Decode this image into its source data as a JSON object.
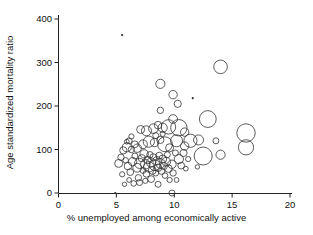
{
  "chart_data": {
    "type": "scatter",
    "title": "",
    "subtitle": "",
    "xlabel": "% unemployed among economically active",
    "ylabel": "Age standardized mortality ratio",
    "xlim": [
      0,
      20
    ],
    "ylim": [
      0,
      400
    ],
    "xticks": [
      0,
      5,
      10,
      15,
      20
    ],
    "yticks": [
      0,
      100,
      200,
      300,
      400
    ],
    "xtick_labels": [
      "0",
      "5",
      "10",
      "15",
      "20"
    ],
    "ytick_labels": [
      "0",
      "100",
      "200",
      "300",
      "400"
    ],
    "grid": false,
    "legend": null,
    "marker": {
      "style": "open-circle",
      "stroke": "#333333",
      "stroke_width": 0.8,
      "fill": "none",
      "size_encodes": "population weight"
    },
    "annotations": [],
    "note": "Bubble plot: marker area scaled by a third variable (weight). r values are in pixel radius as drawn.",
    "points": [
      {
        "x": 5.5,
        "y": 363,
        "r": 1.1
      },
      {
        "x": 11.6,
        "y": 218,
        "r": 1.1
      },
      {
        "x": 4.9,
        "y": 0,
        "r": 1.1
      },
      {
        "x": 14.0,
        "y": 290,
        "r": 6.8
      },
      {
        "x": 8.8,
        "y": 251,
        "r": 4.6
      },
      {
        "x": 9.9,
        "y": 226,
        "r": 4.2
      },
      {
        "x": 10.3,
        "y": 205,
        "r": 3.6
      },
      {
        "x": 8.8,
        "y": 190,
        "r": 3.2
      },
      {
        "x": 12.9,
        "y": 170,
        "r": 8.4
      },
      {
        "x": 9.9,
        "y": 170,
        "r": 4.4
      },
      {
        "x": 16.2,
        "y": 138,
        "r": 9.2
      },
      {
        "x": 16.2,
        "y": 105,
        "r": 7.6
      },
      {
        "x": 12.5,
        "y": 85,
        "r": 9.0
      },
      {
        "x": 14.0,
        "y": 88,
        "r": 4.6
      },
      {
        "x": 12.1,
        "y": 122,
        "r": 5.0
      },
      {
        "x": 11.4,
        "y": 120,
        "r": 6.6
      },
      {
        "x": 10.9,
        "y": 140,
        "r": 4.2
      },
      {
        "x": 10.4,
        "y": 150,
        "r": 8.2
      },
      {
        "x": 10.2,
        "y": 120,
        "r": 6.0
      },
      {
        "x": 10.9,
        "y": 108,
        "r": 4.2
      },
      {
        "x": 10.4,
        "y": 78,
        "r": 4.6
      },
      {
        "x": 10.6,
        "y": 63,
        "r": 3.4
      },
      {
        "x": 10.2,
        "y": 30,
        "r": 2.4
      },
      {
        "x": 9.8,
        "y": 0,
        "r": 3.0
      },
      {
        "x": 9.5,
        "y": 152,
        "r": 7.2
      },
      {
        "x": 9.0,
        "y": 150,
        "r": 4.6
      },
      {
        "x": 8.6,
        "y": 156,
        "r": 3.8
      },
      {
        "x": 8.2,
        "y": 148,
        "r": 4.8
      },
      {
        "x": 7.6,
        "y": 143,
        "r": 5.0
      },
      {
        "x": 7.1,
        "y": 146,
        "r": 4.0
      },
      {
        "x": 6.6,
        "y": 112,
        "r": 3.4
      },
      {
        "x": 6.1,
        "y": 120,
        "r": 3.0
      },
      {
        "x": 5.9,
        "y": 105,
        "r": 4.6
      },
      {
        "x": 5.6,
        "y": 98,
        "r": 3.6
      },
      {
        "x": 6.3,
        "y": 100,
        "r": 3.2
      },
      {
        "x": 6.8,
        "y": 103,
        "r": 4.2
      },
      {
        "x": 7.3,
        "y": 112,
        "r": 4.4
      },
      {
        "x": 7.8,
        "y": 118,
        "r": 5.6
      },
      {
        "x": 8.3,
        "y": 116,
        "r": 4.2
      },
      {
        "x": 8.8,
        "y": 122,
        "r": 3.6
      },
      {
        "x": 9.2,
        "y": 112,
        "r": 7.4
      },
      {
        "x": 9.6,
        "y": 104,
        "r": 4.0
      },
      {
        "x": 5.2,
        "y": 68,
        "r": 4.0
      },
      {
        "x": 5.5,
        "y": 43,
        "r": 2.6
      },
      {
        "x": 5.7,
        "y": 20,
        "r": 2.2
      },
      {
        "x": 6.0,
        "y": 62,
        "r": 3.8
      },
      {
        "x": 6.2,
        "y": 48,
        "r": 3.4
      },
      {
        "x": 6.4,
        "y": 72,
        "r": 4.2
      },
      {
        "x": 6.6,
        "y": 85,
        "r": 3.0
      },
      {
        "x": 6.8,
        "y": 58,
        "r": 4.4
      },
      {
        "x": 6.9,
        "y": 35,
        "r": 3.2
      },
      {
        "x": 7.0,
        "y": 68,
        "r": 5.0
      },
      {
        "x": 7.2,
        "y": 80,
        "r": 3.6
      },
      {
        "x": 7.3,
        "y": 52,
        "r": 3.0
      },
      {
        "x": 7.4,
        "y": 90,
        "r": 4.2
      },
      {
        "x": 7.5,
        "y": 66,
        "r": 4.8
      },
      {
        "x": 7.6,
        "y": 44,
        "r": 3.4
      },
      {
        "x": 7.7,
        "y": 76,
        "r": 3.8
      },
      {
        "x": 7.8,
        "y": 60,
        "r": 5.2
      },
      {
        "x": 7.9,
        "y": 88,
        "r": 3.2
      },
      {
        "x": 8.0,
        "y": 70,
        "r": 4.6
      },
      {
        "x": 8.1,
        "y": 52,
        "r": 4.0
      },
      {
        "x": 8.2,
        "y": 82,
        "r": 3.6
      },
      {
        "x": 8.3,
        "y": 64,
        "r": 5.4
      },
      {
        "x": 8.4,
        "y": 46,
        "r": 3.0
      },
      {
        "x": 8.5,
        "y": 74,
        "r": 4.2
      },
      {
        "x": 8.6,
        "y": 58,
        "r": 3.8
      },
      {
        "x": 8.7,
        "y": 86,
        "r": 3.4
      },
      {
        "x": 8.8,
        "y": 68,
        "r": 4.8
      },
      {
        "x": 8.9,
        "y": 50,
        "r": 3.2
      },
      {
        "x": 9.0,
        "y": 78,
        "r": 4.0
      },
      {
        "x": 9.1,
        "y": 62,
        "r": 3.6
      },
      {
        "x": 9.2,
        "y": 40,
        "r": 2.8
      },
      {
        "x": 9.3,
        "y": 72,
        "r": 4.4
      },
      {
        "x": 9.4,
        "y": 88,
        "r": 3.0
      },
      {
        "x": 9.5,
        "y": 56,
        "r": 3.8
      },
      {
        "x": 9.6,
        "y": 30,
        "r": 2.6
      },
      {
        "x": 9.8,
        "y": 66,
        "r": 4.2
      },
      {
        "x": 9.9,
        "y": 46,
        "r": 3.2
      },
      {
        "x": 5.4,
        "y": 82,
        "r": 3.2
      },
      {
        "x": 5.8,
        "y": 75,
        "r": 2.8
      },
      {
        "x": 6.1,
        "y": 30,
        "r": 2.4
      },
      {
        "x": 6.5,
        "y": 22,
        "r": 2.8
      },
      {
        "x": 7.0,
        "y": 24,
        "r": 3.0
      },
      {
        "x": 7.5,
        "y": 28,
        "r": 2.6
      },
      {
        "x": 8.0,
        "y": 32,
        "r": 3.4
      },
      {
        "x": 8.6,
        "y": 20,
        "r": 3.0
      },
      {
        "x": 6.3,
        "y": 130,
        "r": 2.6
      },
      {
        "x": 5.9,
        "y": 118,
        "r": 2.4
      },
      {
        "x": 8.4,
        "y": 132,
        "r": 3.0
      },
      {
        "x": 9.0,
        "y": 136,
        "r": 2.6
      },
      {
        "x": 10.1,
        "y": 92,
        "r": 3.0
      },
      {
        "x": 10.8,
        "y": 92,
        "r": 3.6
      },
      {
        "x": 11.2,
        "y": 78,
        "r": 2.6
      },
      {
        "x": 11.0,
        "y": 56,
        "r": 2.4
      },
      {
        "x": 12.0,
        "y": 60,
        "r": 2.2
      },
      {
        "x": 13.6,
        "y": 120,
        "r": 3.0
      }
    ]
  },
  "axes": {
    "x_title": "% unemployed among economically active",
    "y_title": "Age standardized mortality ratio"
  }
}
